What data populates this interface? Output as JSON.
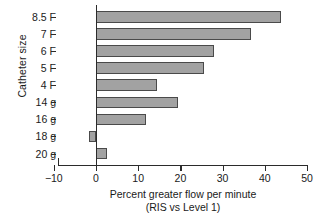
{
  "chart_data": {
    "type": "bar",
    "orientation": "horizontal",
    "title": "",
    "xlabel": "Percent greater flow per minute",
    "xlabel_line2": "(RIS vs Level 1)",
    "ylabel": "Catheter size",
    "categories": [
      "8.5 F",
      "7 F",
      "6 F",
      "5 F",
      "4 F",
      "14 g",
      "16 g",
      "18 g",
      "20 g"
    ],
    "values": [
      43.8,
      36.7,
      28.0,
      25.6,
      14.5,
      19.4,
      11.8,
      -1.7,
      2.6
    ],
    "xlim": [
      -10,
      50
    ],
    "xticks": [
      -10,
      0,
      10,
      20,
      30,
      40,
      50
    ],
    "xtick_labels": [
      "−10",
      "0",
      "10",
      "20",
      "30",
      "40",
      "50"
    ],
    "grid": false,
    "legend": "none",
    "bar_fill_color": "#a2a2a2",
    "bar_edge_color": "#4a4a4a",
    "axis_color": "#2b2b2b"
  }
}
